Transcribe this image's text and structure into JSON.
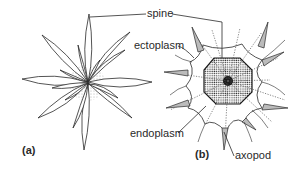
{
  "figure": {
    "panels": [
      {
        "id": "a",
        "label": "(a)",
        "description": "star-shaped radiolarian skeleton of spines"
      },
      {
        "id": "b",
        "label": "(b)",
        "description": "radiolarian cell cross-section"
      }
    ],
    "labels": {
      "spine": "spine",
      "ectoplasm": "ectoplasm",
      "endoplasm": "endoplasm",
      "axopod": "axopod"
    },
    "colors": {
      "line": "#2a2a2a",
      "background": "#ffffff",
      "stipple": "#555555",
      "nucleus": "#1a1a1a"
    }
  }
}
